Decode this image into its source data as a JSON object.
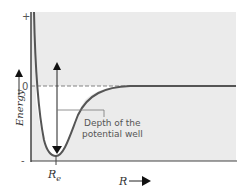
{
  "diagram": {
    "y_axis": {
      "label": "Energy",
      "tick_top": "+",
      "tick_zero": "0",
      "tick_bottom": "-"
    },
    "x_axis": {
      "label": "R",
      "marker": "R",
      "marker_subscript": "e"
    },
    "annotation": {
      "line1": "Depth of the",
      "line2": "potential well"
    },
    "colors": {
      "background_region": "#ebebeb",
      "well_region": "#ffffff",
      "curve": "#555555",
      "axis": "#444444"
    }
  }
}
